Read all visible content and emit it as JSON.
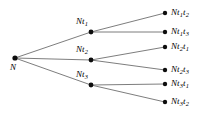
{
  "figure": {
    "background_color": "#ffffff",
    "edge_color": "#6e6e6e",
    "node_color": "#0d0d0d",
    "text_color": "#000000",
    "width": 203,
    "height": 121
  },
  "nodes": {
    "root": {
      "id": "N",
      "base": "N",
      "sub1": "",
      "sub2": "",
      "x": 15,
      "y": 58,
      "label_x": 10,
      "label_y": 63,
      "label_text": "N"
    },
    "level1": [
      {
        "id": "Nt1",
        "base": "N",
        "mid": "t",
        "sub1": "1",
        "x": 91,
        "y": 32,
        "label_x": 76,
        "label_y": 17,
        "label_text": "Nt1"
      },
      {
        "id": "Nt2",
        "base": "N",
        "mid": "t",
        "sub1": "2",
        "x": 91,
        "y": 60,
        "label_x": 76,
        "label_y": 45,
        "label_text": "Nt2"
      },
      {
        "id": "Nt3",
        "base": "N",
        "mid": "t",
        "sub1": "3",
        "x": 91,
        "y": 85,
        "label_x": 76,
        "label_y": 70,
        "label_text": "Nt3"
      }
    ],
    "level2": [
      {
        "id": "Nt1t2",
        "base": "N",
        "mid1": "t",
        "sub1": "1",
        "mid2": "t",
        "sub2": "2",
        "x": 165,
        "y": 13,
        "label_x": 171,
        "label_y": 8,
        "label_text": "Nt1t2",
        "parent": "Nt1"
      },
      {
        "id": "Nt1t3",
        "base": "N",
        "mid1": "t",
        "sub1": "1",
        "mid2": "t",
        "sub2": "3",
        "x": 165,
        "y": 32,
        "label_x": 171,
        "label_y": 27,
        "label_text": "Nt1t3",
        "parent": "Nt1"
      },
      {
        "id": "Nt2t1",
        "base": "N",
        "mid1": "t",
        "sub1": "2",
        "mid2": "t",
        "sub2": "1",
        "x": 165,
        "y": 47,
        "label_x": 171,
        "label_y": 42,
        "label_text": "Nt2t1",
        "parent": "Nt2"
      },
      {
        "id": "Nt2t3",
        "base": "N",
        "mid1": "t",
        "sub1": "2",
        "mid2": "t",
        "sub2": "3",
        "x": 165,
        "y": 70,
        "label_x": 171,
        "label_y": 65,
        "label_text": "Nt2t3",
        "parent": "Nt2"
      },
      {
        "id": "Nt3t1",
        "base": "N",
        "mid1": "t",
        "sub1": "3",
        "mid2": "t",
        "sub2": "1",
        "x": 165,
        "y": 84,
        "label_x": 171,
        "label_y": 79,
        "label_text": "Nt3t1",
        "parent": "Nt3"
      },
      {
        "id": "Nt3t2",
        "base": "N",
        "mid1": "t",
        "sub1": "3",
        "mid2": "t",
        "sub2": "2",
        "x": 165,
        "y": 102,
        "label_x": 171,
        "label_y": 97,
        "label_text": "Nt3t2",
        "parent": "Nt3"
      }
    ]
  },
  "edges": [
    {
      "id": "edge-N-Nt1",
      "from": "N",
      "to": "Nt1",
      "x1": 15,
      "y1": 58,
      "x2": 91,
      "y2": 32
    },
    {
      "id": "edge-N-Nt2",
      "from": "N",
      "to": "Nt2",
      "x1": 15,
      "y1": 58,
      "x2": 91,
      "y2": 60
    },
    {
      "id": "edge-N-Nt3",
      "from": "N",
      "to": "Nt3",
      "x1": 15,
      "y1": 58,
      "x2": 91,
      "y2": 85
    },
    {
      "id": "edge-Nt1-Nt1t2",
      "from": "Nt1",
      "to": "Nt1t2",
      "x1": 91,
      "y1": 32,
      "x2": 165,
      "y2": 13
    },
    {
      "id": "edge-Nt1-Nt1t3",
      "from": "Nt1",
      "to": "Nt1t3",
      "x1": 91,
      "y1": 32,
      "x2": 165,
      "y2": 32
    },
    {
      "id": "edge-Nt2-Nt2t1",
      "from": "Nt2",
      "to": "Nt2t1",
      "x1": 91,
      "y1": 60,
      "x2": 165,
      "y2": 47
    },
    {
      "id": "edge-Nt2-Nt2t3",
      "from": "Nt2",
      "to": "Nt2t3",
      "x1": 91,
      "y1": 60,
      "x2": 165,
      "y2": 70
    },
    {
      "id": "edge-Nt3-Nt3t1",
      "from": "Nt3",
      "to": "Nt3t1",
      "x1": 91,
      "y1": 85,
      "x2": 165,
      "y2": 84
    },
    {
      "id": "edge-Nt3-Nt3t2",
      "from": "Nt3",
      "to": "Nt3t2",
      "x1": 91,
      "y1": 85,
      "x2": 165,
      "y2": 102
    }
  ]
}
